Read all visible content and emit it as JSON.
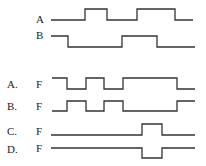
{
  "inputs": [
    {
      "name": "A",
      "label_x": 36,
      "label_y": 13,
      "points": "51,20 85,20 85,9 107,9 107,20 137,20 137,9 175,9 175,20 193,20"
    },
    {
      "name": "B",
      "label_x": 36,
      "label_y": 31,
      "points": "51,36 68,36 68,47 122,47 122,36 157,36 157,47 195,47"
    }
  ],
  "options": [
    {
      "letter": "A.",
      "signal": "F",
      "label_y": 80,
      "points": "52,78 67,78 67,89 86,89 86,78 104,78 104,89 123,89 123,78 177,78 177,89 195,89"
    },
    {
      "letter": "B.",
      "signal": "F",
      "label_y": 101,
      "points": "52,111 67,111 67,101 86,101 86,111 104,111 104,101 123,101 123,111 177,111 177,101 195,101"
    },
    {
      "letter": "C.",
      "signal": "F",
      "label_y": 127,
      "points": "51,135 142,135 142,124 162,124 162,135 195,135"
    },
    {
      "letter": "D.",
      "signal": "F",
      "label_y": 144,
      "points": "51,148 142,148 142,158 162,158 162,148 195,148"
    }
  ]
}
